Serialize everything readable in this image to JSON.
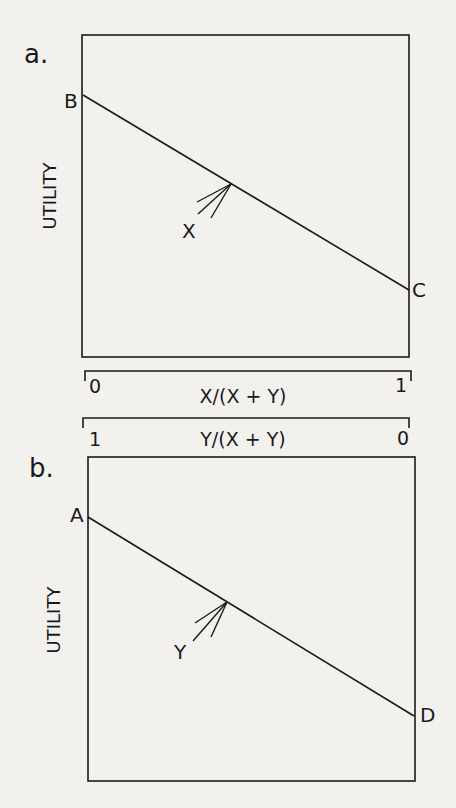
{
  "figure": {
    "panels": [
      {
        "id": "a",
        "letter": "a.",
        "ylabel": "UTILITY",
        "line_start_label": "B",
        "line_end_label": "C",
        "arrow_label": "X"
      },
      {
        "id": "b",
        "letter": "b.",
        "ylabel": "UTILITY",
        "line_start_label": "A",
        "line_end_label": "D",
        "arrow_label": "Y"
      }
    ],
    "axes": [
      {
        "label": "X/(X + Y)",
        "left_tick": "0",
        "right_tick": "1"
      },
      {
        "label": "Y/(X + Y)",
        "left_tick": "1",
        "right_tick": "0"
      }
    ],
    "colors": {
      "ink": "#1a1a1a",
      "paper": "#f2f1ee"
    }
  }
}
